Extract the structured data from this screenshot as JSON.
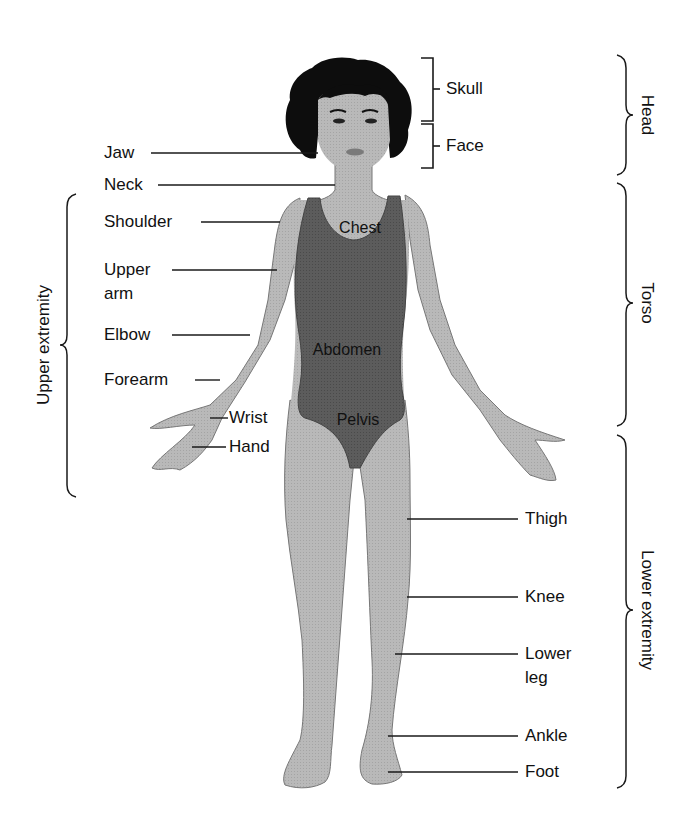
{
  "diagram": {
    "type": "anatomical-regions",
    "colors": {
      "background": "#ffffff",
      "skin": "#b7b7b7",
      "swimsuit": "#5a5a5a",
      "hair": "#0d0d0d",
      "line": "#1a1a1a",
      "text": "#111111"
    },
    "left_labels": {
      "jaw": "Jaw",
      "neck": "Neck",
      "shoulder": "Shoulder",
      "upper_arm_1": "Upper",
      "upper_arm_2": "arm",
      "elbow": "Elbow",
      "forearm": "Forearm",
      "wrist": "Wrist",
      "hand": "Hand"
    },
    "head_labels": {
      "skull": "Skull",
      "face": "Face"
    },
    "body_labels": {
      "chest": "Chest",
      "abdomen": "Abdomen",
      "pelvis": "Pelvis"
    },
    "right_labels": {
      "thigh": "Thigh",
      "knee": "Knee",
      "lower_leg_1": "Lower",
      "lower_leg_2": "leg",
      "ankle": "Ankle",
      "foot": "Foot"
    },
    "regions": {
      "head": "Head",
      "torso": "Torso",
      "lower_extremity": "Lower extremity",
      "upper_extremity": "Upper extremity"
    }
  }
}
